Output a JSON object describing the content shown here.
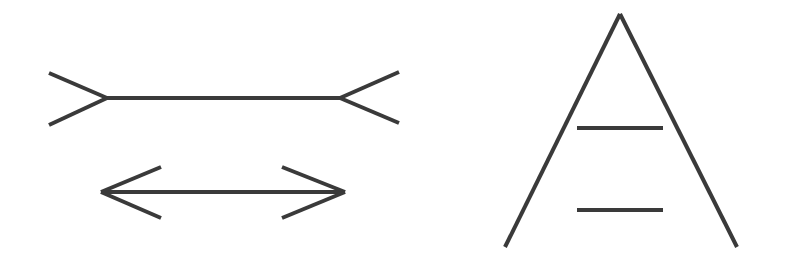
{
  "figure": {
    "background": "#ffffff",
    "stroke_color": "#3a3a3a",
    "stroke_width": 4
  },
  "illusions": [
    {
      "name": "Müller-Lyer illusion",
      "shapes": [
        {
          "id": "fins-out-line",
          "shaft": {
            "x1": 107,
            "y1": 98,
            "x2": 340,
            "y2": 98
          },
          "left_fins": [
            {
              "x1": 49,
              "y1": 73,
              "x2": 107,
              "y2": 98
            },
            {
              "x1": 49,
              "y1": 125,
              "x2": 107,
              "y2": 98
            }
          ],
          "right_fins": [
            {
              "x1": 340,
              "y1": 98,
              "x2": 399,
              "y2": 72
            },
            {
              "x1": 340,
              "y1": 98,
              "x2": 399,
              "y2": 123
            }
          ]
        },
        {
          "id": "fins-in-line",
          "shaft": {
            "x1": 101,
            "y1": 192,
            "x2": 345,
            "y2": 192
          },
          "left_head": [
            {
              "x1": 161,
              "y1": 167,
              "x2": 101,
              "y2": 192
            },
            {
              "x1": 161,
              "y1": 218,
              "x2": 101,
              "y2": 192
            }
          ],
          "right_head": [
            {
              "x1": 282,
              "y1": 167,
              "x2": 345,
              "y2": 192
            },
            {
              "x1": 282,
              "y1": 218,
              "x2": 345,
              "y2": 192
            }
          ]
        }
      ]
    },
    {
      "name": "Ponzo illusion",
      "apex": {
        "x": 620,
        "y": 14
      },
      "legs": [
        {
          "x1": 620,
          "y1": 14,
          "x2": 505,
          "y2": 247
        },
        {
          "x1": 620,
          "y1": 14,
          "x2": 737,
          "y2": 247
        }
      ],
      "bars": [
        {
          "x1": 577,
          "y1": 128,
          "x2": 663,
          "y2": 128
        },
        {
          "x1": 577,
          "y1": 210,
          "x2": 663,
          "y2": 210
        }
      ]
    }
  ]
}
